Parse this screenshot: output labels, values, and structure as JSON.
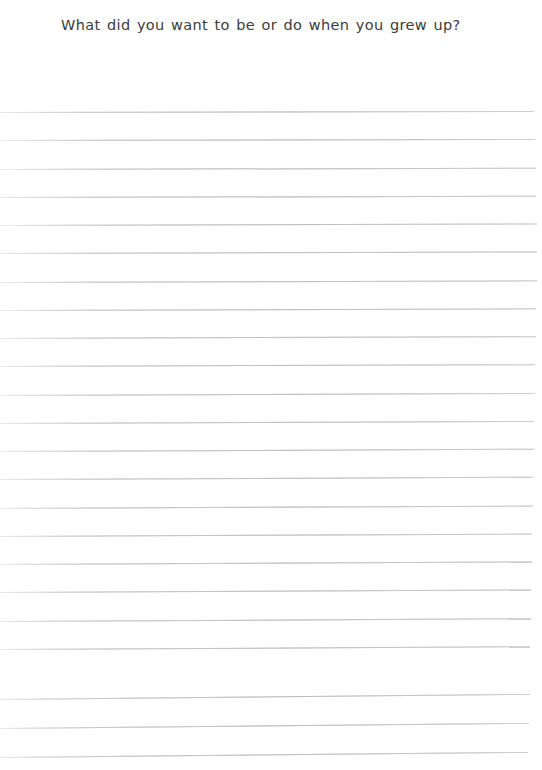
{
  "page": {
    "background_color": "#ffffff",
    "width": 542,
    "height": 770
  },
  "worksheet": {
    "prompt": "What did you want to be or do when you grew up?",
    "prompt_color": "#3b3b3b",
    "answer_area": {
      "line_count": 23,
      "line_color": "#d6d6d6",
      "first_line_y": 112,
      "line_spacing": 28.3,
      "line_left_x": 0,
      "line_right_x": 530,
      "lines": [
        {
          "index": 1,
          "y": 112,
          "left": 0,
          "width": 534,
          "skew_deg": -0.12
        },
        {
          "index": 2,
          "y": 140,
          "left": 0,
          "width": 535,
          "skew_deg": -0.12
        },
        {
          "index": 3,
          "y": 169,
          "left": 0,
          "width": 536,
          "skew_deg": -0.14
        },
        {
          "index": 4,
          "y": 197,
          "left": 0,
          "width": 536,
          "skew_deg": -0.14
        },
        {
          "index": 5,
          "y": 225,
          "left": 0,
          "width": 537,
          "skew_deg": -0.16
        },
        {
          "index": 6,
          "y": 253,
          "left": 0,
          "width": 537,
          "skew_deg": -0.16
        },
        {
          "index": 7,
          "y": 282,
          "left": 0,
          "width": 537,
          "skew_deg": -0.18
        },
        {
          "index": 8,
          "y": 310,
          "left": 0,
          "width": 536,
          "skew_deg": -0.18
        },
        {
          "index": 9,
          "y": 338,
          "left": 0,
          "width": 536,
          "skew_deg": -0.2
        },
        {
          "index": 10,
          "y": 366,
          "left": 0,
          "width": 535,
          "skew_deg": -0.2
        },
        {
          "index": 11,
          "y": 395,
          "left": 0,
          "width": 535,
          "skew_deg": -0.22
        },
        {
          "index": 12,
          "y": 423,
          "left": 0,
          "width": 534,
          "skew_deg": -0.22
        },
        {
          "index": 13,
          "y": 451,
          "left": 0,
          "width": 534,
          "skew_deg": -0.24
        },
        {
          "index": 14,
          "y": 479,
          "left": 0,
          "width": 533,
          "skew_deg": -0.24
        },
        {
          "index": 15,
          "y": 508,
          "left": 0,
          "width": 533,
          "skew_deg": -0.26
        },
        {
          "index": 16,
          "y": 536,
          "left": 0,
          "width": 532,
          "skew_deg": -0.26
        },
        {
          "index": 17,
          "y": 564,
          "left": 0,
          "width": 532,
          "skew_deg": -0.28
        },
        {
          "index": 18,
          "y": 592,
          "left": 0,
          "width": 531,
          "skew_deg": -0.28
        },
        {
          "index": 19,
          "y": 621,
          "left": 0,
          "width": 531,
          "skew_deg": -0.3
        },
        {
          "index": 20,
          "y": 649,
          "left": 0,
          "width": 530,
          "skew_deg": -0.3
        },
        {
          "index": 21,
          "y": 699,
          "left": 0,
          "width": 530,
          "skew_deg": -0.55
        },
        {
          "index": 22,
          "y": 728,
          "left": 0,
          "width": 529,
          "skew_deg": -0.55
        },
        {
          "index": 23,
          "y": 757,
          "left": 0,
          "width": 528,
          "skew_deg": -0.55
        }
      ]
    }
  }
}
